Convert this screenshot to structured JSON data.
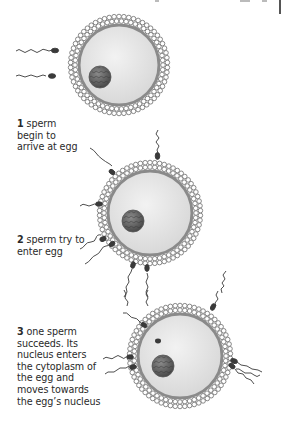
{
  "figure": {
    "steps": [
      {
        "number": "1",
        "text": "sperm begin to arrive at egg",
        "lines": [
          "sperm",
          "begin to",
          "arrive at egg"
        ]
      },
      {
        "number": "2",
        "text": "sperm try to enter egg",
        "lines": [
          "sperm try to",
          "enter egg"
        ]
      },
      {
        "number": "3",
        "text": "one sperm succeeds. Its nucleus enters the cytoplasm of the egg and moves towards the egg's nucleus",
        "lines": [
          "one sperm",
          "succeeds. Its",
          "nucleus enters",
          "the cytoplasm of",
          "the egg and",
          "moves towards",
          "the egg’s nucleus"
        ]
      }
    ],
    "icons": [
      "egg-cell-icon",
      "sperm-icon",
      "nucleus-icon",
      "corona-radiata-icon"
    ],
    "colors": {
      "egg_fill": "#e6e6e6",
      "egg_membrane": "#8a8a8a",
      "corona": "#9a9a9a",
      "nucleus": "#6e6e6e",
      "sperm": "#3a3a3a",
      "text": "#2a2a2a"
    }
  }
}
